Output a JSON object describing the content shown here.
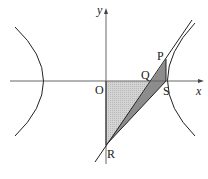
{
  "diagram": {
    "type": "coordinate-geometry",
    "axes": {
      "x_label": "x",
      "y_label": "y",
      "origin_label": "O"
    },
    "points": {
      "P": {
        "label": "P"
      },
      "Q": {
        "label": "Q"
      },
      "S": {
        "label": "S"
      },
      "R": {
        "label": "R"
      },
      "O": {
        "label": "O"
      }
    },
    "colors": {
      "stroke": "#222222",
      "axis": "#555555",
      "light_fill": "#c8c8c8",
      "dark_fill": "#8a8a8a"
    }
  }
}
